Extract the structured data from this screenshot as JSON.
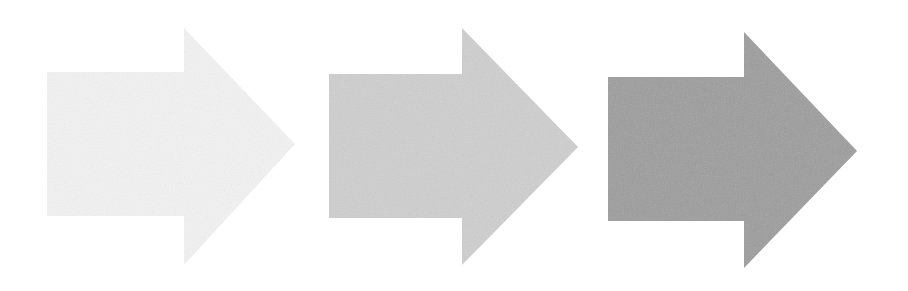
{
  "diagram": {
    "type": "process-arrows",
    "background": "#ffffff",
    "arrows": [
      {
        "id": "arrow-1",
        "step": 1,
        "fill": "#f3f3f3",
        "body": {
          "x": 47,
          "y": 72,
          "width": 137,
          "height": 144
        },
        "head": {
          "base_x": 184,
          "top_y": 28,
          "bottom_y": 265,
          "tip_x": 295,
          "tip_y": 144
        }
      },
      {
        "id": "arrow-2",
        "step": 2,
        "fill": "#cfcfcf",
        "body": {
          "x": 329,
          "y": 74,
          "width": 133,
          "height": 144
        },
        "head": {
          "base_x": 462,
          "top_y": 28,
          "bottom_y": 265,
          "tip_x": 578,
          "tip_y": 147
        }
      },
      {
        "id": "arrow-3",
        "step": 3,
        "fill": "#9e9e9e",
        "body": {
          "x": 608,
          "y": 77,
          "width": 136,
          "height": 144
        },
        "head": {
          "base_x": 744,
          "top_y": 32,
          "bottom_y": 268,
          "tip_x": 857,
          "tip_y": 151
        }
      }
    ]
  }
}
